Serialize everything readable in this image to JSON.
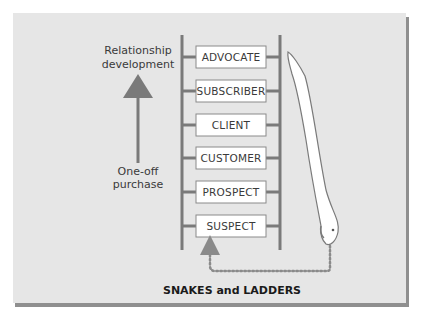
{
  "figure": {
    "caption": "SNAKES and LADDERS",
    "top_label_line1": "Relationship",
    "top_label_line2": "development",
    "bottom_label_line1": "One-off",
    "bottom_label_line2": "purchase",
    "ladder_rungs": [
      {
        "label": "ADVOCATE"
      },
      {
        "label": "SUBSCRIBER"
      },
      {
        "label": "CLIENT"
      },
      {
        "label": "CUSTOMER"
      },
      {
        "label": "PROSPECT"
      },
      {
        "label": "SUSPECT"
      }
    ],
    "arrow_direction": "up",
    "snake": {
      "from": "ADVOCATE",
      "to": "SUSPECT",
      "return_path": "dotted"
    }
  },
  "colors": {
    "panel_background": "#e6e6e6",
    "panel_shadow": "#8f8f8f",
    "ladder": "#7a7a7a",
    "box_fill": "#ffffff",
    "box_border": "#8a8a8a",
    "snake_fill": "#ffffff",
    "snake_outline": "#7a7a7a",
    "text": "#3a3a3a"
  }
}
